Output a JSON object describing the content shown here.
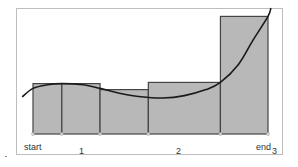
{
  "chart_data": {
    "type": "bar",
    "subtype": "riemann-sum-rectangles-with-curve",
    "title": "",
    "xlabel": "",
    "ylabel": "",
    "x_tick_labels": [
      {
        "label": "start",
        "x": 0.0
      },
      {
        "label": "1",
        "x": 1.0
      },
      {
        "label": "2",
        "x": 2.0
      },
      {
        "label": "end",
        "x": 3.0
      },
      {
        "label": "3",
        "x": 3.0
      }
    ],
    "xlim": [
      -0.15,
      3.15
    ],
    "ylim": [
      0,
      1.0
    ],
    "grid": false,
    "legend": null,
    "partition": [
      0.0,
      0.4,
      0.93,
      1.6,
      2.6,
      3.26
    ],
    "rectangles": [
      {
        "x0": 0.0,
        "x1": 0.4,
        "height": 0.42
      },
      {
        "x0": 0.4,
        "x1": 0.93,
        "height": 0.42
      },
      {
        "x0": 0.93,
        "x1": 1.6,
        "height": 0.37
      },
      {
        "x0": 1.6,
        "x1": 2.6,
        "height": 0.43
      },
      {
        "x0": 2.6,
        "x1": 3.26,
        "height": 0.98
      }
    ],
    "curve": {
      "description": "smooth curve rising slightly, dipping to a minimum near x=2, then rising steeply to the right",
      "points": [
        [
          -0.15,
          0.31
        ],
        [
          0.0,
          0.38
        ],
        [
          0.2,
          0.41
        ],
        [
          0.4,
          0.42
        ],
        [
          0.7,
          0.41
        ],
        [
          0.93,
          0.38
        ],
        [
          1.2,
          0.34
        ],
        [
          1.5,
          0.31
        ],
        [
          1.8,
          0.3
        ],
        [
          2.1,
          0.32
        ],
        [
          2.4,
          0.37
        ],
        [
          2.6,
          0.43
        ],
        [
          2.85,
          0.58
        ],
        [
          3.05,
          0.78
        ],
        [
          3.26,
          0.98
        ],
        [
          3.3,
          1.05
        ]
      ]
    },
    "colors": {
      "bar_fill": "#b8b8b8",
      "bar_stroke": "#444444",
      "curve": "#1a1a1a",
      "frame": "#bbbbbb"
    }
  },
  "labels": {
    "start": "start",
    "tick1": "1",
    "tick2": "2",
    "end": "end",
    "tick3": "3"
  }
}
